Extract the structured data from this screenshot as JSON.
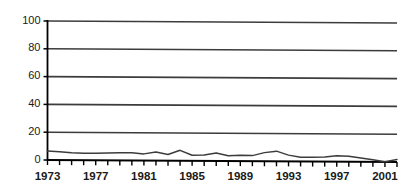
{
  "chart_data": {
    "type": "line",
    "title": "",
    "subtitle": "",
    "xlabel": "",
    "ylabel": "",
    "xlim": [
      1973,
      2002
    ],
    "ylim": [
      0,
      100
    ],
    "ytick_labels": [
      "100",
      "80",
      "60",
      "40",
      "20",
      "0"
    ],
    "yticks": [
      100,
      80,
      60,
      40,
      20,
      0
    ],
    "xtick_labels": [
      "1973",
      "1977",
      "1981",
      "1985",
      "1989",
      "1993",
      "1997",
      "2001"
    ],
    "xticks": [
      1973,
      1977,
      1981,
      1985,
      1989,
      1993,
      1997,
      2001
    ],
    "grid": true,
    "grid_orientation": "horizontal",
    "legend": false,
    "legend_position": "none",
    "line_color": "#3c3c3c",
    "axis_color": "#000000",
    "grid_color": "#3c3c3c",
    "background_color": "#ffffff",
    "x": [
      1973,
      1974,
      1975,
      1976,
      1977,
      1978,
      1979,
      1980,
      1981,
      1982,
      1983,
      1984,
      1985,
      1986,
      1987,
      1988,
      1989,
      1990,
      1991,
      1992,
      1993,
      1994,
      1995,
      1996,
      1997,
      1998,
      1999,
      2000,
      2001,
      2002
    ],
    "series": [
      {
        "name": "series-1",
        "values": [
          6.5,
          6.0,
          5.3,
          5.0,
          5.0,
          5.2,
          5.5,
          5.5,
          4.8,
          6.2,
          4.5,
          7.5,
          4.0,
          4.2,
          5.8,
          3.8,
          4.3,
          4.0,
          6.2,
          7.3,
          4.5,
          3.0,
          3.0,
          3.3,
          4.2,
          4.0,
          2.8,
          1.5,
          0.2,
          1.8
        ]
      }
    ]
  }
}
